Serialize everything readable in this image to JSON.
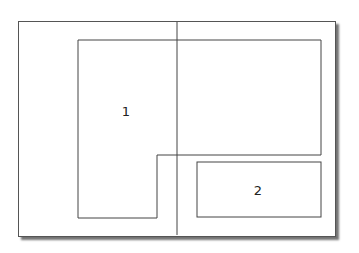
{
  "diagram": {
    "page": {
      "x": 18,
      "y": 21,
      "width": 316,
      "height": 214
    },
    "divider_x": 177,
    "regions": [
      {
        "id": "region-1",
        "label": "1",
        "label_pos": [
          126,
          111
        ],
        "points": "78,40 177,40 177,40 321,40 321,155 157,155 157,218 78,218"
      },
      {
        "id": "region-2",
        "label": "2",
        "label_pos": [
          258,
          190
        ],
        "rect": {
          "x": 197,
          "y": 162,
          "width": 124,
          "height": 55
        }
      }
    ],
    "stroke_color": "#444444"
  }
}
